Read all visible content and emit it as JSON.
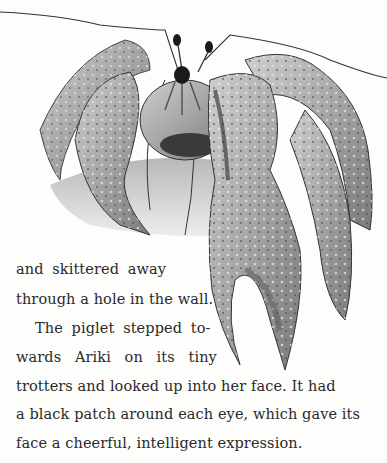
{
  "illustration": {
    "subject": "coconut crab (robber crab) pencil drawing",
    "alt": "A large crab with long antennae and big spotted claws"
  },
  "text": {
    "lines": [
      "and skittered away",
      "through a hole in the wall.",
      "The piglet stepped to-",
      "wards Ariki on its tiny",
      "trotters and looked up into her face. It had",
      "a black patch around each eye, which gave its",
      "face a cheerful, intelligent expression."
    ]
  }
}
